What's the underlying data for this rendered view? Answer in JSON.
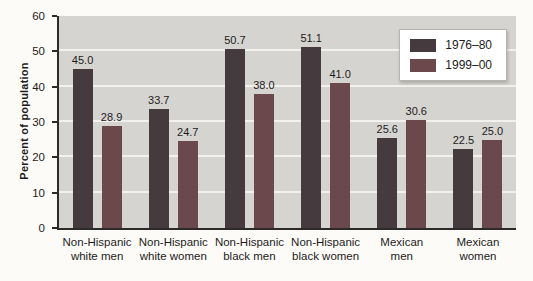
{
  "colors": {
    "page_bg": "#fcfbf8",
    "plot_bg": "#d5d4d0",
    "gridline": "#f2f1ee",
    "axis": "#2e2a2a",
    "text": "#1e1b1b",
    "legend_bg": "#ffffff",
    "legend_border": "#b8b5b0",
    "series_1976_80": "#453a3d",
    "series_1999_00": "#6b484c"
  },
  "chart_data": {
    "type": "bar",
    "title": "",
    "xlabel": "",
    "ylabel": "Percent of population",
    "ylim": [
      0,
      60
    ],
    "yticks": [
      0,
      10,
      20,
      30,
      40,
      50,
      60
    ],
    "grid": "horizontal white gridlines every 10 units",
    "legend_position": "top-right",
    "value_labels": true,
    "categories": [
      "Non-Hispanic white men",
      "Non-Hispanic white women",
      "Non-Hispanic black men",
      "Non-Hispanic black women",
      "Mexican men",
      "Mexican women"
    ],
    "category_label_lines": [
      [
        "Non-Hispanic",
        "white men"
      ],
      [
        "Non-Hispanic",
        "white women"
      ],
      [
        "Non-Hispanic",
        "black men"
      ],
      [
        "Non-Hispanic",
        "black women"
      ],
      [
        "Mexican",
        "men"
      ],
      [
        "Mexican",
        "women"
      ]
    ],
    "series": [
      {
        "name": "1976–80",
        "color": "#453a3d",
        "values": [
          45.0,
          33.7,
          50.7,
          51.1,
          25.6,
          22.5
        ],
        "value_labels": [
          "45.0",
          "33.7",
          "50.7",
          "51.1",
          "25.6",
          "22.5"
        ]
      },
      {
        "name": "1999–00",
        "color": "#6b484c",
        "values": [
          28.9,
          24.7,
          38.0,
          41.0,
          30.6,
          25.0
        ],
        "value_labels": [
          "28.9",
          "24.7",
          "38.0",
          "41.0",
          "30.6",
          "25.0"
        ]
      }
    ]
  }
}
